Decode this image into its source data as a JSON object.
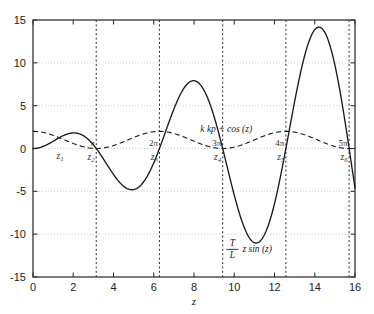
{
  "chart_data": {
    "type": "line",
    "title": "",
    "xlabel": "z",
    "ylabel": "",
    "xlim": [
      0,
      16
    ],
    "ylim": [
      -15,
      15
    ],
    "xticks": [
      0,
      2,
      4,
      6,
      8,
      10,
      12,
      14,
      16
    ],
    "xticklabels": [
      "0",
      "2",
      "4",
      "6",
      "8",
      "10",
      "12",
      "14",
      "16"
    ],
    "yticks": [
      -15,
      -10,
      -5,
      0,
      5,
      10,
      15
    ],
    "yticklabels": [
      "-15",
      "-10",
      "-5",
      "0",
      "5",
      "10",
      "15"
    ],
    "grid": "dotted horizontal gridlines at y ticks",
    "legend": "none - inline curve annotations",
    "series": [
      {
        "name": "T/L z sin (z)",
        "style": "solid",
        "color": "#1a1a1a",
        "label_numerator": "T",
        "label_denominator": "L",
        "label_rest": "z sin (z)",
        "annotation_x": 11.0,
        "annotation_y": -11.6,
        "x": [
          0.0,
          0.25,
          0.5,
          0.75,
          1.0,
          1.25,
          1.5,
          1.75,
          2.0,
          2.25,
          2.5,
          2.75,
          3.0,
          3.25,
          3.5,
          3.75,
          4.0,
          4.25,
          4.5,
          4.75,
          5.0,
          5.25,
          5.5,
          5.75,
          6.0,
          6.25,
          6.5,
          6.75,
          7.0,
          7.25,
          7.5,
          7.75,
          8.0,
          8.25,
          8.5,
          8.75,
          9.0,
          9.25,
          9.5,
          9.75,
          10.0,
          10.25,
          10.5,
          10.75,
          11.0,
          11.25,
          11.5,
          11.75,
          12.0,
          12.25,
          12.5,
          12.75,
          13.0,
          13.25,
          13.5,
          13.75,
          14.0,
          14.25,
          14.5,
          14.75,
          15.0,
          15.25,
          15.5,
          15.75,
          16.0
        ],
        "y": [
          0.0,
          0.15,
          0.43,
          0.77,
          1.14,
          1.49,
          1.71,
          1.77,
          1.64,
          1.32,
          0.83,
          0.21,
          -0.47,
          -1.17,
          -1.81,
          -2.35,
          -2.72,
          -2.92,
          -2.93,
          -2.76,
          -2.41,
          -1.92,
          -1.33,
          -0.69,
          -0.06,
          0.53,
          1.04,
          1.45,
          1.76,
          1.96,
          2.06,
          2.06,
          1.98,
          1.84,
          1.65,
          1.44,
          1.22,
          1.0,
          0.8,
          0.62,
          0.47,
          0.34,
          0.23,
          0.14,
          0.06,
          -0.01,
          -0.09,
          -0.2,
          -0.34,
          -0.53,
          -0.78,
          -1.09,
          -1.47,
          -1.9,
          -2.39,
          -2.92,
          -3.47,
          -4.01,
          -4.53,
          -5.01,
          -5.42,
          -5.75,
          -5.98,
          -6.11,
          -6.12
        ]
      },
      {
        "name": "k kp + cos (z)",
        "style": "dashed",
        "color": "#1a1a1a",
        "annotation_x": 9.6,
        "annotation_y": 1.9
      }
    ],
    "vlines": [
      {
        "x": 3.1416,
        "pi_label": "π",
        "z_label": "z",
        "z_sub": "2",
        "style": "dotted"
      },
      {
        "x": 6.2832,
        "pi_label": "2π",
        "z_label": "z",
        "z_sub": "3",
        "style": "dotted"
      },
      {
        "x": 9.4248,
        "pi_label": "3π",
        "z_label": "z",
        "z_sub": "4",
        "style": "dotted"
      },
      {
        "x": 12.5664,
        "pi_label": "4π",
        "z_label": "z",
        "z_sub": "5",
        "style": "dotted"
      },
      {
        "x": 15.708,
        "pi_label": "5π",
        "z_label": "z",
        "z_sub": "6",
        "style": "dotted"
      }
    ],
    "point_labels": [
      {
        "x": 1.35,
        "label": "z",
        "sub": "1"
      }
    ],
    "annotations": [
      {
        "text": "k kp + cos (z)",
        "x": 9.6,
        "y": 1.9
      },
      {
        "text": "T/L z sin (z)",
        "x": 11.0,
        "y": -11.6
      }
    ]
  }
}
